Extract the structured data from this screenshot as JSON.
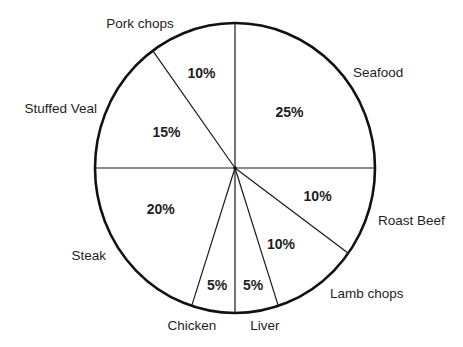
{
  "chart_data": {
    "type": "pie",
    "title": "",
    "start": "top",
    "direction": "clockwise",
    "slices": [
      {
        "label": "Seafood",
        "value": 25,
        "value_label": "25%"
      },
      {
        "label": "Roast Beef",
        "value": 10,
        "value_label": "10%"
      },
      {
        "label": "Lamb chops",
        "value": 10,
        "value_label": "10%"
      },
      {
        "label": "Liver",
        "value": 5,
        "value_label": "5%"
      },
      {
        "label": "Chicken",
        "value": 5,
        "value_label": "5%"
      },
      {
        "label": "Steak",
        "value": 20,
        "value_label": "20%"
      },
      {
        "label": "Stuffed Veal",
        "value": 15,
        "value_label": "15%"
      },
      {
        "label": "Pork chops",
        "value": 10,
        "value_label": "10%"
      }
    ],
    "colors": {
      "stroke": "#111111",
      "fill": "#ffffff",
      "text": "#1e1e1e"
    }
  }
}
